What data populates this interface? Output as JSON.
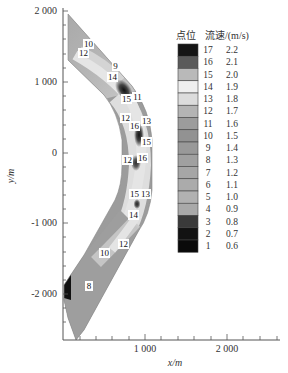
{
  "chart_data": {
    "type": "heatmap",
    "title": "",
    "xlabel": "x/m",
    "ylabel": "y/m",
    "xlim": [
      0,
      2600
    ],
    "ylim": [
      -2550,
      2050
    ],
    "x_ticks": [
      {
        "value": 1000,
        "label": "1 000"
      },
      {
        "value": 2000,
        "label": "2 000"
      }
    ],
    "y_ticks": [
      {
        "value": 2000,
        "label": "2 000"
      },
      {
        "value": 1000,
        "label": "1 000"
      },
      {
        "value": 0,
        "label": "0"
      },
      {
        "value": -1000,
        "label": "-1 000"
      },
      {
        "value": -2000,
        "label": "-2 000"
      }
    ],
    "grid": false,
    "legend": {
      "position": "right",
      "header_point": "点位",
      "header_speed": "流速/(m/s)",
      "levels": [
        {
          "level": "17",
          "speed": "2.2",
          "color": "#151515"
        },
        {
          "level": "16",
          "speed": "2.1",
          "color": "#5a5a5a"
        },
        {
          "level": "15",
          "speed": "2.0",
          "color": "#b9b9b9"
        },
        {
          "level": "14",
          "speed": "1.9",
          "color": "#efefef"
        },
        {
          "level": "13",
          "speed": "1.8",
          "color": "#dcdcdc"
        },
        {
          "level": "12",
          "speed": "1.7",
          "color": "#b4b4b4"
        },
        {
          "level": "11",
          "speed": "1.6",
          "color": "#9c9c9c"
        },
        {
          "level": "10",
          "speed": "1.5",
          "color": "#929292"
        },
        {
          "level": "9",
          "speed": "1.4",
          "color": "#999999"
        },
        {
          "level": "8",
          "speed": "1.3",
          "color": "#a0a0a0"
        },
        {
          "level": "7",
          "speed": "1.2",
          "color": "#a6a6a6"
        },
        {
          "level": "6",
          "speed": "1.1",
          "color": "#ababab"
        },
        {
          "level": "5",
          "speed": "1.0",
          "color": "#b1b1b1"
        },
        {
          "level": "4",
          "speed": "0.9",
          "color": "#a9a9a9"
        },
        {
          "level": "3",
          "speed": "0.8",
          "color": "#3a3a3a"
        },
        {
          "level": "2",
          "speed": "0.7",
          "color": "#121212"
        },
        {
          "level": "1",
          "speed": "0.6",
          "color": "#0a0a0a"
        }
      ]
    },
    "contour_labels": [
      {
        "label": "10",
        "x": 310,
        "y": 1510
      },
      {
        "label": "12",
        "x": 260,
        "y": 1400
      },
      {
        "label": "9",
        "x": 650,
        "y": 1200
      },
      {
        "label": "14",
        "x": 600,
        "y": 1060
      },
      {
        "label": "15",
        "x": 770,
        "y": 750
      },
      {
        "label": "11",
        "x": 900,
        "y": 780
      },
      {
        "label": "12",
        "x": 750,
        "y": 490
      },
      {
        "label": "16",
        "x": 870,
        "y": 380
      },
      {
        "label": "13",
        "x": 1010,
        "y": 450
      },
      {
        "label": "15",
        "x": 1010,
        "y": 150
      },
      {
        "label": "12",
        "x": 790,
        "y": -100
      },
      {
        "label": "16",
        "x": 980,
        "y": -70
      },
      {
        "label": "15",
        "x": 870,
        "y": -580
      },
      {
        "label": "13",
        "x": 1010,
        "y": -580
      },
      {
        "label": "14",
        "x": 870,
        "y": -880
      },
      {
        "label": "12",
        "x": 750,
        "y": -1290
      },
      {
        "label": "10",
        "x": 520,
        "y": -1420
      },
      {
        "label": "8",
        "x": 320,
        "y": -1890
      }
    ]
  }
}
